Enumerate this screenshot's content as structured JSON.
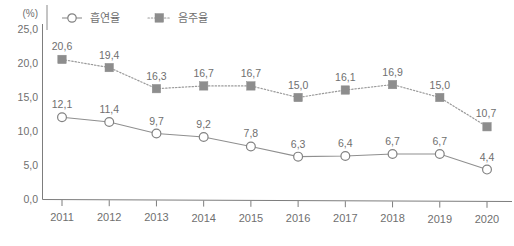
{
  "chart_data": {
    "type": "line",
    "title": "",
    "subtitle": "",
    "xlabel": "",
    "ylabel": "",
    "unit_label": "(%)",
    "categories": [
      "2011",
      "2012",
      "2013",
      "2014",
      "2015",
      "2016",
      "2017",
      "2018",
      "2019",
      "2020"
    ],
    "series": [
      {
        "name": "흡연율",
        "marker": "open-circle",
        "line_style": "solid",
        "color": "#8f8f8f",
        "values": [
          12.1,
          11.4,
          9.7,
          9.2,
          7.8,
          6.3,
          6.4,
          6.7,
          6.7,
          4.4
        ],
        "value_labels": [
          "12,1",
          "11,4",
          "9,7",
          "9,2",
          "7,8",
          "6,3",
          "6,4",
          "6,7",
          "6,7",
          "4,4"
        ]
      },
      {
        "name": "음주율",
        "marker": "filled-square",
        "line_style": "dotted",
        "color": "#8d8d8d",
        "values": [
          20.6,
          19.4,
          16.3,
          16.7,
          16.7,
          15.0,
          16.1,
          16.9,
          15.0,
          10.7
        ],
        "value_labels": [
          "20,6",
          "19,4",
          "16,3",
          "16,7",
          "16,7",
          "15,0",
          "16,1",
          "16,9",
          "15,0",
          "10,7"
        ]
      }
    ],
    "ylim": [
      0.0,
      25.0
    ],
    "yticks": [
      0.0,
      5.0,
      10.0,
      15.0,
      20.0,
      25.0
    ],
    "ytick_labels": [
      "0,0",
      "5,0",
      "10,0",
      "15,0",
      "20,0",
      "25,0"
    ],
    "grid": false,
    "legend_position": "top"
  },
  "legend": {
    "items": [
      {
        "label": "흡연율",
        "marker": "open-circle"
      },
      {
        "label": "음주율",
        "marker": "filled-square"
      }
    ]
  }
}
